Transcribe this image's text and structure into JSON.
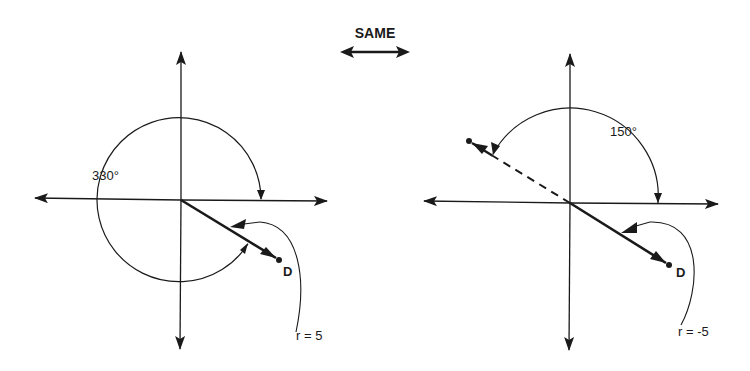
{
  "title": "SAME",
  "colors": {
    "ink": "#1a1a1a",
    "background": "#ffffff"
  },
  "left_diagram": {
    "angle_label": "330°",
    "point_label": "D",
    "radius_label": "r = 5"
  },
  "right_diagram": {
    "angle_label": "150°",
    "point_label": "D",
    "radius_label": "r = -5"
  }
}
